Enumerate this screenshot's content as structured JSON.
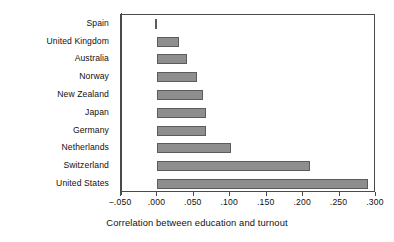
{
  "chart_data": {
    "type": "bar",
    "orientation": "horizontal",
    "title": "",
    "xlabel": "Correlation between education and turnout",
    "ylabel": "",
    "xlim": [
      -0.05,
      0.3
    ],
    "xticks": [
      -0.05,
      0.0,
      0.05,
      0.1,
      0.15,
      0.2,
      0.25,
      0.3
    ],
    "xticklabels": [
      "−.050",
      ".000",
      ".050",
      ".100",
      ".150",
      ".200",
      ".250",
      ".300"
    ],
    "grid": false,
    "legend": false,
    "categories": [
      "Spain",
      "United Kingdom",
      "Australia",
      "Norway",
      "New Zealand",
      "Japan",
      "Germany",
      "Netherlands",
      "Switzerland",
      "United States"
    ],
    "values": [
      -0.004,
      0.03,
      0.04,
      0.054,
      0.062,
      0.067,
      0.067,
      0.101,
      0.209,
      0.289
    ],
    "bar_color": "#8e8e8e",
    "bar_edge_color": "#5c5c5c",
    "axis_color": "#4a4a4a",
    "background_color": "#ffffff"
  },
  "axis_title": "Correlation between education and turnout"
}
